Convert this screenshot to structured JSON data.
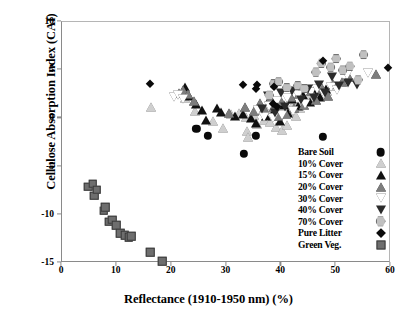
{
  "chart_data": {
    "type": "scatter",
    "title": "",
    "xlabel": "Reflectance (1910-1950 nm) (%)",
    "ylabel": "Cellulose Absorption Index (CAI)",
    "xlim": [
      0,
      60
    ],
    "ylim": [
      -15,
      10
    ],
    "xticks": [
      0,
      10,
      20,
      30,
      40,
      50,
      60
    ],
    "yticks": [
      10,
      5,
      0,
      -5,
      -10,
      -15
    ],
    "xtick_labels": [
      "0",
      "10",
      "20",
      "30",
      "40",
      "50",
      "60"
    ],
    "ytick_labels": [
      "10",
      "5",
      "0",
      "-5",
      "-10",
      "-15"
    ],
    "grid": false,
    "legend_position": "lower-right-inside",
    "series": [
      {
        "name": "Bare Soil",
        "marker": "circle-filled",
        "color": "#0a0a0a",
        "points": [
          [
            24.5,
            -1.1
          ],
          [
            26.6,
            -1.8
          ],
          [
            33.2,
            -3.7
          ],
          [
            35.4,
            -1.8
          ],
          [
            39.2,
            1.4
          ],
          [
            39.0,
            1.7
          ],
          [
            47.6,
            -1.9
          ]
        ]
      },
      {
        "name": "10% Cover",
        "marker": "triangle-up-light",
        "color": "#cfcfcf",
        "points": [
          [
            16.3,
            1.2
          ],
          [
            22.4,
            2.1
          ],
          [
            24.3,
            0.8
          ],
          [
            27.6,
            -0.3
          ],
          [
            29.4,
            -1.0
          ],
          [
            30.9,
            0.5
          ],
          [
            32.2,
            0.6
          ],
          [
            33.5,
            0.1
          ],
          [
            33.8,
            -1.3
          ],
          [
            34.0,
            -1.9
          ],
          [
            35.1,
            0.4
          ],
          [
            35.6,
            -0.6
          ],
          [
            36.3,
            0.9
          ],
          [
            36.8,
            -0.2
          ],
          [
            37.5,
            1.0
          ],
          [
            38.0,
            -0.4
          ],
          [
            38.4,
            0.2
          ],
          [
            39.1,
            -0.9
          ],
          [
            39.6,
            0.5
          ],
          [
            40.2,
            -1.2
          ],
          [
            41.0,
            -0.7
          ],
          [
            41.4,
            0.8
          ],
          [
            42.1,
            1.5
          ],
          [
            42.6,
            0.2
          ],
          [
            43.4,
            1.1
          ],
          [
            44.2,
            1.9
          ],
          [
            45.0,
            2.2
          ],
          [
            46.1,
            2.6
          ],
          [
            47.2,
            3.0
          ],
          [
            48.3,
            2.8
          ],
          [
            49.1,
            3.4
          ]
        ]
      },
      {
        "name": "15% Cover",
        "marker": "triangle-up-black",
        "color": "#111111",
        "points": [
          [
            22.4,
            3.3
          ],
          [
            23.2,
            2.3
          ],
          [
            24.4,
            1.5
          ],
          [
            25.5,
            0.9
          ],
          [
            26.3,
            -0.2
          ],
          [
            28.2,
            1.1
          ],
          [
            29.0,
            0.7
          ],
          [
            31.5,
            0.2
          ],
          [
            33.0,
            0.5
          ],
          [
            34.4,
            0.0
          ],
          [
            35.3,
            -0.5
          ],
          [
            36.4,
            1.2
          ],
          [
            37.2,
            0.3
          ],
          [
            38.0,
            2.1
          ],
          [
            38.9,
            1.0
          ],
          [
            39.7,
            -0.3
          ],
          [
            40.5,
            1.4
          ],
          [
            41.3,
            0.6
          ],
          [
            42.0,
            2.0
          ],
          [
            43.0,
            1.3
          ],
          [
            44.0,
            2.4
          ],
          [
            45.2,
            1.7
          ],
          [
            46.0,
            2.9
          ],
          [
            47.0,
            2.2
          ],
          [
            48.1,
            3.1
          ]
        ]
      },
      {
        "name": "20% Cover",
        "marker": "triangle-up-gray",
        "color": "#7d7d7d",
        "points": [
          [
            21.3,
            2.6
          ],
          [
            22.0,
            2.9
          ],
          [
            23.0,
            2.5
          ],
          [
            24.0,
            1.8
          ],
          [
            30.5,
            0.6
          ],
          [
            33.3,
            1.2
          ],
          [
            35.0,
            0.8
          ],
          [
            36.1,
            1.6
          ],
          [
            37.0,
            0.9
          ],
          [
            37.9,
            2.0
          ],
          [
            38.6,
            1.2
          ],
          [
            39.4,
            0.3
          ],
          [
            40.0,
            1.8
          ],
          [
            40.8,
            0.5
          ],
          [
            41.7,
            2.2
          ],
          [
            42.4,
            1.1
          ],
          [
            43.3,
            2.5
          ],
          [
            44.1,
            1.4
          ],
          [
            45.4,
            2.8
          ],
          [
            46.3,
            1.9
          ],
          [
            47.4,
            3.2
          ],
          [
            48.6,
            2.3
          ],
          [
            49.5,
            3.6
          ],
          [
            51.0,
            3.8
          ],
          [
            52.4,
            4.3
          ],
          [
            57.2,
            4.6
          ]
        ]
      },
      {
        "name": "30% Cover",
        "marker": "triangle-down-open",
        "color": "#ffffff",
        "points": [
          [
            20.4,
            2.2
          ],
          [
            21.2,
            2.4
          ],
          [
            22.1,
            2.0
          ],
          [
            35.8,
            0.9
          ],
          [
            36.9,
            0.1
          ],
          [
            37.8,
            1.3
          ],
          [
            38.5,
            0.0
          ],
          [
            39.3,
            1.8
          ],
          [
            40.1,
            0.4
          ],
          [
            41.1,
            2.1
          ],
          [
            42.2,
            0.8
          ],
          [
            43.1,
            2.4
          ],
          [
            44.4,
            1.5
          ],
          [
            45.5,
            2.7
          ],
          [
            46.5,
            3.1
          ],
          [
            47.8,
            2.5
          ],
          [
            49.0,
            3.3
          ],
          [
            50.2,
            2.9
          ],
          [
            52.0,
            4.5
          ],
          [
            55.8,
            4.7
          ]
        ]
      },
      {
        "name": "40% Cover",
        "marker": "triangle-down-filled",
        "color": "#2b2b2b",
        "points": [
          [
            36.5,
            1.0
          ],
          [
            37.6,
            2.3
          ],
          [
            38.8,
            0.6
          ],
          [
            39.9,
            2.6
          ],
          [
            40.7,
            1.2
          ],
          [
            41.9,
            2.8
          ],
          [
            43.5,
            1.9
          ],
          [
            44.8,
            3.0
          ],
          [
            45.9,
            2.1
          ],
          [
            46.8,
            3.5
          ],
          [
            47.9,
            2.6
          ],
          [
            49.3,
            4.3
          ],
          [
            50.5,
            3.4
          ],
          [
            52.2,
            3.7
          ],
          [
            53.8,
            3.5
          ]
        ]
      },
      {
        "name": "70% Cover",
        "marker": "hexagon-gray",
        "color": "#c0c0c0",
        "points": [
          [
            37.8,
            2.4
          ],
          [
            38.6,
            3.6
          ],
          [
            39.5,
            3.8
          ],
          [
            41.0,
            3.2
          ],
          [
            43.0,
            3.4
          ],
          [
            44.2,
            3.1
          ],
          [
            46.3,
            4.8
          ],
          [
            47.3,
            5.7
          ],
          [
            49.0,
            5.3
          ],
          [
            50.0,
            6.2
          ],
          [
            51.2,
            5.0
          ],
          [
            52.5,
            5.4
          ],
          [
            54.0,
            4.0
          ],
          [
            55.0,
            6.6
          ]
        ]
      },
      {
        "name": "Pure Litter",
        "marker": "diamond-black",
        "color": "#0a0a0a",
        "points": [
          [
            16.0,
            3.6
          ],
          [
            33.0,
            3.5
          ],
          [
            35.5,
            3.5
          ],
          [
            35.4,
            3.1
          ],
          [
            38.6,
            3.3
          ],
          [
            38.5,
            1.5
          ],
          [
            39.2,
            1.2
          ],
          [
            47.6,
            6.0
          ],
          [
            59.4,
            5.2
          ]
        ]
      },
      {
        "name": "Green Veg.",
        "marker": "square-gray",
        "color": "#6e6e6e",
        "points": [
          [
            4.8,
            -7.1
          ],
          [
            5.6,
            -6.8
          ],
          [
            5.9,
            -8.0
          ],
          [
            6.3,
            -7.4
          ],
          [
            7.6,
            -9.6
          ],
          [
            7.9,
            -9.2
          ],
          [
            8.6,
            -10.7
          ],
          [
            9.2,
            -10.5
          ],
          [
            9.9,
            -11.1
          ],
          [
            10.6,
            -11.9
          ],
          [
            11.4,
            -12.1
          ],
          [
            12.2,
            -12.3
          ],
          [
            12.6,
            -12.2
          ],
          [
            16.1,
            -13.9
          ],
          [
            18.3,
            -14.8
          ]
        ]
      }
    ],
    "legend_entries": [
      {
        "label": "Bare Soil",
        "marker": "circle-filled"
      },
      {
        "label": "10% Cover",
        "marker": "triangle-up-light"
      },
      {
        "label": "15% Cover",
        "marker": "triangle-up-black"
      },
      {
        "label": "20% Cover",
        "marker": "triangle-up-gray"
      },
      {
        "label": "30% Cover",
        "marker": "triangle-down-open"
      },
      {
        "label": "40% Cover",
        "marker": "triangle-down-filled"
      },
      {
        "label": "70% Cover",
        "marker": "hexagon-gray"
      },
      {
        "label": "Pure Litter",
        "marker": "diamond-black"
      },
      {
        "label": "Green Veg.",
        "marker": "square-gray"
      }
    ]
  }
}
